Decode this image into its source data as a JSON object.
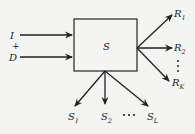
{
  "diagram": {
    "type": "system-block",
    "block": {
      "label": "S"
    },
    "inputs": [
      {
        "label": "I",
        "sub": ""
      },
      {
        "label": "+",
        "sub": ""
      },
      {
        "label": "D",
        "sub": ""
      }
    ],
    "right_outputs": [
      {
        "label": "R",
        "sub": "1"
      },
      {
        "label": "R",
        "sub": "2"
      },
      {
        "label": "R",
        "sub": "K"
      }
    ],
    "right_ellipsis": "⋮",
    "bottom_outputs": [
      {
        "label": "S",
        "sub": "1"
      },
      {
        "label": "S",
        "sub": "2"
      },
      {
        "label": "S",
        "sub": "L"
      }
    ],
    "bottom_ellipsis": "• • •",
    "colors": {
      "ink": "#222222",
      "background": "#f4f4f2"
    }
  }
}
